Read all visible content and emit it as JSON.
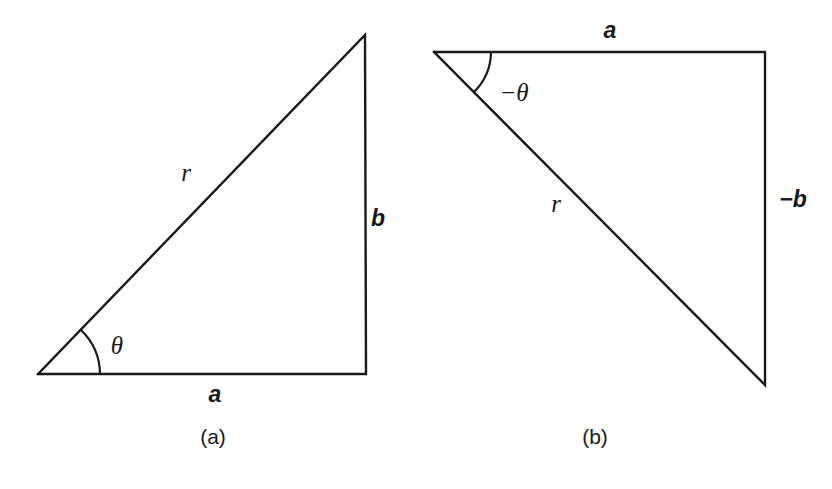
{
  "figure": {
    "type": "geometry-diagram",
    "background_color": "#ffffff",
    "stroke_color": "#1a1a1a",
    "width": 832,
    "height": 489,
    "panels": [
      {
        "id": "panel-a",
        "caption": "(a)",
        "caption_pos": {
          "x": 213,
          "y": 436
        },
        "triangle": {
          "points": "38,374 365,35 366,374 38,374",
          "vertices": [
            {
              "name": "angle-vertex",
              "x": 38,
              "y": 374
            },
            {
              "name": "apex",
              "x": 365,
              "y": 35
            },
            {
              "name": "right-angle-corner",
              "x": 366,
              "y": 374
            }
          ]
        },
        "angle_arc": {
          "label": "θ",
          "path": "M 100,374 A 62,62 0 0 0 81.0,330.0",
          "label_pos": {
            "x": 117,
            "y": 345
          }
        },
        "labels": [
          {
            "name": "hypotenuse-label",
            "text": "r",
            "x": 186,
            "y": 172,
            "style": "italic-serif"
          },
          {
            "name": "vertical-side-label",
            "text": "b",
            "x": 378,
            "y": 218,
            "style": "sans-bold-italic"
          },
          {
            "name": "base-label",
            "text": "a",
            "x": 215,
            "y": 394,
            "style": "sans-bold-italic"
          }
        ]
      },
      {
        "id": "panel-b",
        "caption": "(b)",
        "caption_pos": {
          "x": 595,
          "y": 436
        },
        "triangle": {
          "points": "434,52 765,52 765,385 434,52",
          "vertices": [
            {
              "name": "angle-vertex",
              "x": 434,
              "y": 52
            },
            {
              "name": "right-angle-corner",
              "x": 765,
              "y": 52
            },
            {
              "name": "bottom-vertex",
              "x": 765,
              "y": 385
            }
          ]
        },
        "angle_arc": {
          "label": "−θ",
          "path": "M 491,52 A 57,57 0 0 1 474,92.0",
          "label_pos": {
            "x": 514,
            "y": 92
          }
        },
        "labels": [
          {
            "name": "top-side-label",
            "text": "a",
            "x": 610,
            "y": 30,
            "style": "sans-bold-italic"
          },
          {
            "name": "vertical-side-label",
            "text": "−b",
            "x": 793,
            "y": 199,
            "style": "sans-bold-italic"
          },
          {
            "name": "hypotenuse-label",
            "text": "r",
            "x": 556,
            "y": 203,
            "style": "italic-serif"
          }
        ]
      }
    ]
  }
}
